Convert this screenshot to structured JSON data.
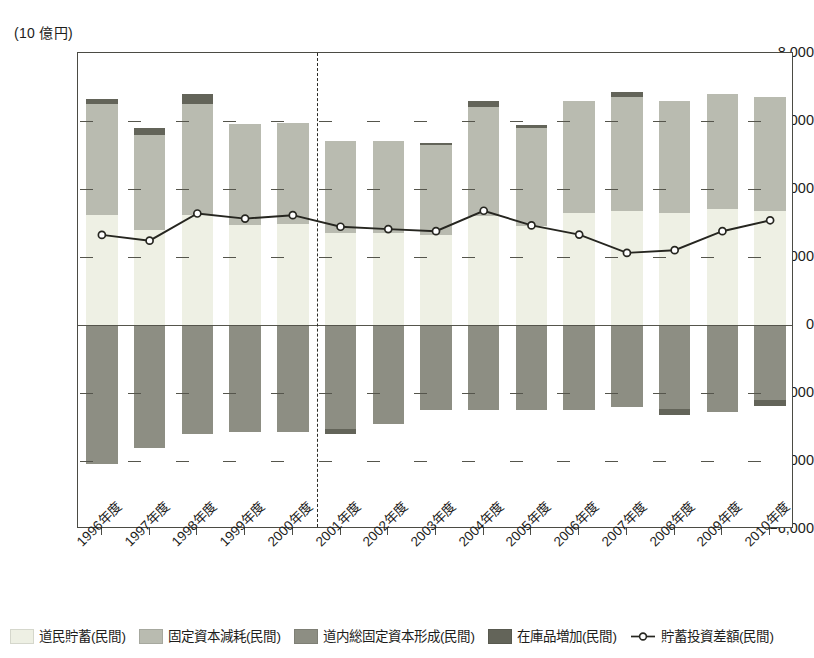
{
  "axis": {
    "unit_caption": "(10 億円)",
    "y_ticks": [
      8000,
      6000,
      4000,
      2000,
      0,
      -2000,
      -4000,
      -6000
    ],
    "y_tick_labels": [
      "8,000",
      "6,000",
      "4,000",
      "2,000",
      "0",
      "−2,000",
      "−4,000",
      "−6,000"
    ],
    "ylim": [
      -6000,
      8000
    ],
    "y_major_step": 2000
  },
  "legend": {
    "position": "bottom",
    "items": [
      {
        "label": "道民貯蓄(民間)",
        "color": "#eef0e4",
        "type": "swatch"
      },
      {
        "label": "固定資本減耗(民間)",
        "color": "#b9bbb0",
        "type": "swatch"
      },
      {
        "label": "道内総固定資本形成(民間)",
        "color": "#8d8e83",
        "type": "swatch"
      },
      {
        "label": "在庫品増加(民間)",
        "color": "#636459",
        "type": "swatch"
      },
      {
        "label": "貯蓄投資差額(民間)",
        "color": "#262620",
        "type": "line-marker"
      }
    ]
  },
  "annotations": {
    "divider_after_category": "2000年度",
    "divider_style": "dashed-vertical"
  },
  "chart_data": {
    "type": "bar",
    "title": "",
    "subtitle": "",
    "xlabel": "",
    "ylabel": "(10 億円)",
    "ylim": [
      -6000,
      8000
    ],
    "grid": false,
    "stacked": true,
    "categories": [
      "1996年度",
      "1997年度",
      "1998年度",
      "1999年度",
      "2000年度",
      "2001年度",
      "2002年度",
      "2003年度",
      "2004年度",
      "2005年度",
      "2006年度",
      "2007年度",
      "2008年度",
      "2009年度",
      "2010年度"
    ],
    "series": [
      {
        "name": "道民貯蓄(民間)",
        "color": "#eef0e4",
        "stack": "positive",
        "values": [
          3450,
          3400,
          3200,
          3150,
          3200,
          3050,
          2950,
          2800,
          2750,
          2600,
          1900,
          1450,
          1050,
          1020,
          1650
        ]
      },
      {
        "name": "固定資本減耗(民間)",
        "color": "#b9bbb0",
        "stack": "positive",
        "values": [
          3250,
          2800,
          3250,
          2950,
          2970,
          2700,
          2700,
          2650,
          3200,
          2900,
          3300,
          3350,
          3300,
          3400,
          3350
        ]
      },
      {
        "name": "在庫品増加(民間)",
        "color": "#636459",
        "stack": "positive-cap",
        "values": [
          150,
          180,
          290,
          0,
          0,
          0,
          0,
          60,
          180,
          80,
          0,
          150,
          0,
          0,
          0
        ]
      },
      {
        "name": "道内総固定資本形成(民間)",
        "color": "#8d8e83",
        "stack": "negative",
        "values": [
          -4100,
          -3620,
          -3220,
          -3150,
          -3150,
          -3050,
          -2900,
          -2500,
          -2500,
          -2500,
          -2500,
          -2400,
          -2480,
          -2550,
          -2200
        ]
      },
      {
        "name": "在庫品増加(民間)",
        "color": "#636459",
        "stack": "negative-cap",
        "values": [
          0,
          0,
          0,
          0,
          0,
          -150,
          0,
          0,
          0,
          0,
          0,
          0,
          -170,
          0,
          -180
        ]
      }
    ],
    "line_series": {
      "name": "貯蓄投資差額(民間)",
      "color": "#262620",
      "marker": "circle-open",
      "values": [
        2650,
        2480,
        3280,
        3130,
        3230,
        2890,
        2820,
        2760,
        3360,
        2930,
        2660,
        2120,
        2200,
        2760,
        3080
      ]
    }
  }
}
